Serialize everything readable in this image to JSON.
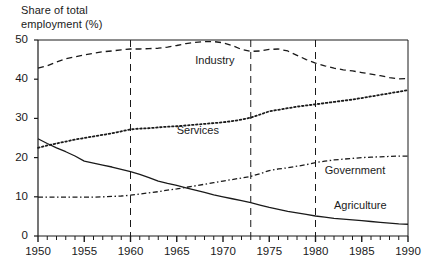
{
  "chart_data": {
    "type": "line",
    "title": "",
    "ylabel": "Share of total\nemployment (%)",
    "xlabel": "",
    "xlim": [
      1950,
      1990
    ],
    "ylim": [
      0,
      50
    ],
    "grid": false,
    "legend_position": "inline-annotations",
    "yticks": [
      0,
      10,
      20,
      30,
      40,
      50
    ],
    "ytick_labels": [
      "0",
      "10",
      "20",
      "30",
      "40",
      "50"
    ],
    "xticks": [
      1950,
      1955,
      1960,
      1965,
      1970,
      1975,
      1980,
      1985,
      1990
    ],
    "xtick_labels": [
      "1950",
      "1955",
      "1960",
      "1965",
      "1970",
      "1975",
      "1980",
      "1985",
      "1990"
    ],
    "minor_xtick_interval": 1,
    "vertical_reference_lines": [
      1960,
      1973,
      1980
    ],
    "x": [
      1950,
      1951,
      1952,
      1953,
      1954,
      1955,
      1956,
      1957,
      1958,
      1959,
      1960,
      1961,
      1962,
      1963,
      1964,
      1965,
      1966,
      1967,
      1968,
      1969,
      1970,
      1971,
      1972,
      1973,
      1974,
      1975,
      1976,
      1977,
      1978,
      1979,
      1980,
      1981,
      1982,
      1983,
      1984,
      1985,
      1986,
      1987,
      1988,
      1989,
      1990
    ],
    "series": [
      {
        "name": "Industry",
        "style": "dashed",
        "color": "#1a1a1a",
        "label_x": 1967,
        "label_y": 44.6,
        "values": [
          42.8,
          43.4,
          44.4,
          45.2,
          45.7,
          46.2,
          46.6,
          47.0,
          47.2,
          47.5,
          47.7,
          47.7,
          47.8,
          47.9,
          48.2,
          48.6,
          49.1,
          49.4,
          49.6,
          49.6,
          49.3,
          48.6,
          47.6,
          47.1,
          47.2,
          47.6,
          47.7,
          47.2,
          46.1,
          45.0,
          44.1,
          43.4,
          42.8,
          42.4,
          42.1,
          41.7,
          41.3,
          40.9,
          40.4,
          40.1,
          40.2
        ]
      },
      {
        "name": "Services",
        "style": "dotted",
        "color": "#1a1a1a",
        "label_x": 1965,
        "label_y": 26.8,
        "values": [
          22.5,
          23.1,
          23.6,
          24.1,
          24.6,
          25.0,
          25.4,
          25.8,
          26.2,
          26.7,
          27.2,
          27.4,
          27.5,
          27.7,
          27.9,
          28.0,
          28.2,
          28.4,
          28.6,
          28.8,
          29.0,
          29.3,
          29.7,
          30.2,
          31.0,
          31.8,
          32.2,
          32.6,
          33.0,
          33.3,
          33.6,
          33.9,
          34.2,
          34.5,
          34.8,
          35.2,
          35.6,
          36.0,
          36.4,
          36.8,
          37.2
        ]
      },
      {
        "name": "Government",
        "style": "dash-dot",
        "color": "#1a1a1a",
        "label_x": 1981,
        "label_y": 16.6,
        "values": [
          9.9,
          9.9,
          9.9,
          9.9,
          9.9,
          9.9,
          9.9,
          10.0,
          10.1,
          10.2,
          10.4,
          10.7,
          11.0,
          11.3,
          11.7,
          12.0,
          12.4,
          12.8,
          13.2,
          13.6,
          14.0,
          14.4,
          14.8,
          15.2,
          15.9,
          16.7,
          17.1,
          17.4,
          17.8,
          18.2,
          18.7,
          19.1,
          19.4,
          19.6,
          19.8,
          20.0,
          20.1,
          20.2,
          20.3,
          20.4,
          20.4
        ]
      },
      {
        "name": "Agriculture",
        "style": "solid",
        "color": "#1a1a1a",
        "label_x": 1982,
        "label_y": 7.6,
        "values": [
          24.8,
          23.6,
          22.5,
          21.5,
          20.4,
          19.1,
          18.6,
          18.1,
          17.6,
          17.0,
          16.4,
          15.7,
          14.9,
          14.0,
          13.4,
          12.9,
          12.3,
          11.7,
          11.1,
          10.5,
          10.0,
          9.5,
          9.0,
          8.5,
          7.9,
          7.3,
          6.8,
          6.3,
          5.9,
          5.5,
          5.1,
          4.8,
          4.5,
          4.3,
          4.1,
          3.9,
          3.7,
          3.5,
          3.3,
          3.1,
          3.0
        ]
      }
    ]
  },
  "plot_geometry": {
    "left": 38,
    "right": 408,
    "top": 40,
    "bottom": 236
  }
}
